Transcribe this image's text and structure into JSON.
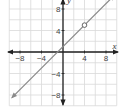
{
  "chart_data": {
    "type": "line",
    "title": "",
    "xlabel": "x",
    "ylabel": "y",
    "xlim": [
      -10,
      10
    ],
    "ylim": [
      -10,
      10
    ],
    "grid": true,
    "grid_step": 2,
    "xticks": [
      -8,
      -4,
      4,
      8
    ],
    "yticks": [
      8,
      4,
      -4,
      -8
    ],
    "xtick_labels": [
      "−8",
      "−4",
      "4",
      "8"
    ],
    "ytick_labels": [
      "8",
      "4",
      "−4",
      "−8"
    ],
    "series": [
      {
        "name": "y = x + 1",
        "equation": "y = x + 1",
        "x": [
          -9.5,
          9.5
        ],
        "y": [
          -8.5,
          10.5
        ],
        "arrows": "both",
        "color": "#888888"
      }
    ],
    "annotations": [
      {
        "type": "open-circle",
        "x": 4,
        "y": 5
      }
    ],
    "legend": null
  },
  "colors": {
    "grid": "#d9d9d9",
    "axis": "#222222",
    "line": "#8a8a8a"
  }
}
